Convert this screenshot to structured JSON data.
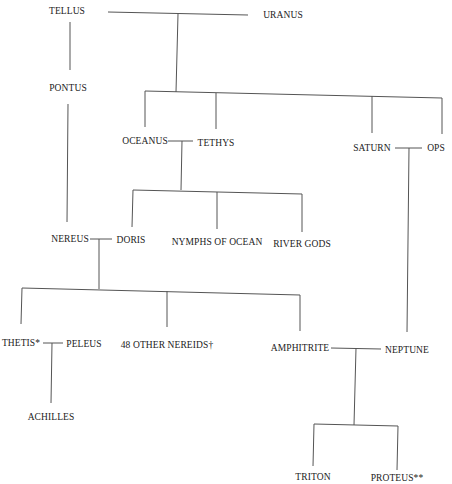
{
  "diagram": {
    "type": "genealogy",
    "nodes": {
      "tellus": "TELLUS",
      "uranus": "URANUS",
      "pontus": "PONTUS",
      "oceanus": "OCEANUS",
      "tethys": "TETHYS",
      "saturn": "SATURN",
      "ops": "OPS",
      "nereus": "NEREUS",
      "doris": "DORIS",
      "nymphs_of_ocean": "NYMPHS OF OCEAN",
      "river_gods": "RIVER GODS",
      "thetis": "THETIS*",
      "peleus": "PELEUS",
      "other_nereids": "48 OTHER NEREIDS†",
      "amphitrite": "AMPHITRITE",
      "neptune": "NEPTUNE",
      "achilles": "ACHILLES",
      "triton": "TRITON",
      "proteus": "PROTEUS**"
    },
    "unions": [
      [
        "tellus",
        "uranus"
      ],
      [
        "oceanus",
        "tethys"
      ],
      [
        "saturn",
        "ops"
      ],
      [
        "nereus",
        "doris"
      ],
      [
        "thetis",
        "peleus"
      ],
      [
        "amphitrite",
        "neptune"
      ]
    ],
    "descent": [
      {
        "parents": [
          "tellus"
        ],
        "children": [
          "pontus"
        ]
      },
      {
        "parents": [
          "tellus",
          "uranus"
        ],
        "children": [
          "oceanus",
          "tethys",
          "saturn",
          "ops"
        ]
      },
      {
        "parents": [
          "pontus"
        ],
        "children": [
          "nereus"
        ]
      },
      {
        "parents": [
          "oceanus",
          "tethys"
        ],
        "children": [
          "doris",
          "nymphs_of_ocean",
          "river_gods"
        ]
      },
      {
        "parents": [
          "saturn",
          "ops"
        ],
        "children": [
          "neptune"
        ]
      },
      {
        "parents": [
          "nereus",
          "doris"
        ],
        "children": [
          "thetis",
          "other_nereids",
          "amphitrite"
        ]
      },
      {
        "parents": [
          "thetis",
          "peleus"
        ],
        "children": [
          "achilles"
        ]
      },
      {
        "parents": [
          "amphitrite",
          "neptune"
        ],
        "children": [
          "triton",
          "proteus"
        ]
      }
    ]
  }
}
